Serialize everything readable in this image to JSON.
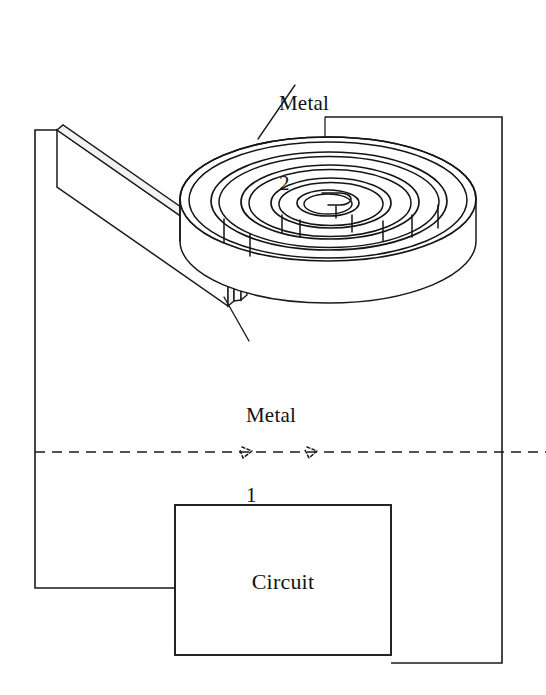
{
  "figure": {
    "type": "technical-diagram",
    "background_color": "#ffffff",
    "line_color": "#1a1a1a"
  },
  "labels": {
    "metal2": {
      "line1": "Metal",
      "line2": "2"
    },
    "metal1": {
      "line1": "Metal",
      "line2": "1"
    }
  },
  "circuit_block": {
    "label": "Circuit"
  },
  "diagram_elements": {
    "coil_name": "spiral-coil",
    "plate_name": "flat-metal-plate",
    "wire_left_name": "left-lead-wire",
    "wire_right_name": "right-lead-wire",
    "dashed_line_name": "reference-dashed-line"
  }
}
